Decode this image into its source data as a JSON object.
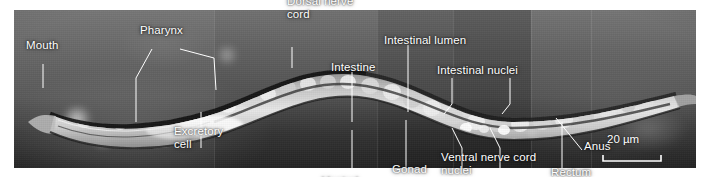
{
  "figure": {
    "kind": "dic-light-micrograph",
    "specimen": "nematode",
    "plate": {
      "x": 14,
      "y": 10,
      "width": 682,
      "height": 158
    },
    "label_color": "#ffffff",
    "leader_color": "#ffffff",
    "background_color": "#ffffff"
  },
  "annotations": [
    {
      "name": "mouth",
      "text": "Mouth",
      "x": 26,
      "y": 51,
      "leaders": [
        [
          [
            43,
            64
          ],
          [
            43,
            88
          ]
        ]
      ]
    },
    {
      "name": "pharynx",
      "text": "Pharynx",
      "x": 140,
      "y": 36,
      "leaders": [
        [
          [
            152,
            49
          ],
          [
            136,
            78
          ],
          [
            136,
            122
          ]
        ],
        [
          [
            180,
            49
          ],
          [
            214,
            58
          ],
          [
            216,
            90
          ]
        ]
      ]
    },
    {
      "name": "excretory-cell",
      "text": "Excretory\ncell",
      "x": 174,
      "y": 150,
      "leaders": [
        [
          [
            201,
            148
          ],
          [
            201,
            112
          ]
        ]
      ]
    },
    {
      "name": "dorsal-nerve-cord",
      "text": "Dorsal nerve\ncord",
      "x": 287,
      "y": 20,
      "leaders": [
        [
          [
            292,
            47
          ],
          [
            292,
            68
          ]
        ]
      ]
    },
    {
      "name": "intestine",
      "text": "Intestine",
      "x": 331,
      "y": 73,
      "leaders": [
        [
          [
            352,
            72
          ],
          [
            352,
            122
          ]
        ]
      ]
    },
    {
      "name": "ventral-nerve-cord",
      "text": "Ventral\nnerve cord",
      "x": 322,
      "y": 200,
      "leaders": [
        [
          [
            352,
            185
          ],
          [
            352,
            130
          ]
        ]
      ]
    },
    {
      "name": "intestinal-lumen",
      "text": "Intestinal lumen",
      "x": 384,
      "y": 46,
      "leaders": [
        [
          [
            408,
            45
          ],
          [
            408,
            112
          ]
        ]
      ]
    },
    {
      "name": "gonad",
      "text": "Gonad",
      "x": 392,
      "y": 175,
      "leaders": [
        [
          [
            406,
            170
          ],
          [
            406,
            120
          ]
        ]
      ]
    },
    {
      "name": "intestinal-nuclei",
      "text": "Intestinal nuclei",
      "x": 437,
      "y": 76,
      "leaders": [
        [
          [
            452,
            78
          ],
          [
            452,
            104
          ],
          [
            444,
            114
          ]
        ],
        [
          [
            510,
            78
          ],
          [
            510,
            104
          ],
          [
            502,
            114
          ]
        ]
      ]
    },
    {
      "name": "ventral-nerve-cord-nuclei",
      "text": "Ventral nerve cord\nnuclei",
      "x": 441,
      "y": 176,
      "leaders": [
        [
          [
            462,
            172
          ],
          [
            462,
            148
          ],
          [
            452,
            128
          ]
        ],
        [
          [
            500,
            172
          ],
          [
            500,
            148
          ],
          [
            490,
            128
          ]
        ]
      ]
    },
    {
      "name": "anus",
      "text": "Anus",
      "x": 584,
      "y": 152,
      "leaders": [
        [
          [
            582,
            150
          ],
          [
            556,
            118
          ]
        ]
      ]
    },
    {
      "name": "rectum",
      "text": "Rectum",
      "x": 551,
      "y": 178,
      "leaders": [
        [
          [
            562,
            172
          ],
          [
            562,
            122
          ]
        ]
      ]
    }
  ],
  "scale_bar": {
    "name": "scale-bar",
    "value": "20",
    "unit": "µm",
    "text": "20 µm",
    "text_x": 607,
    "text_y": 145,
    "bar_x1": 603,
    "bar_x2": 661,
    "bar_y": 161,
    "tick_height": 6
  }
}
